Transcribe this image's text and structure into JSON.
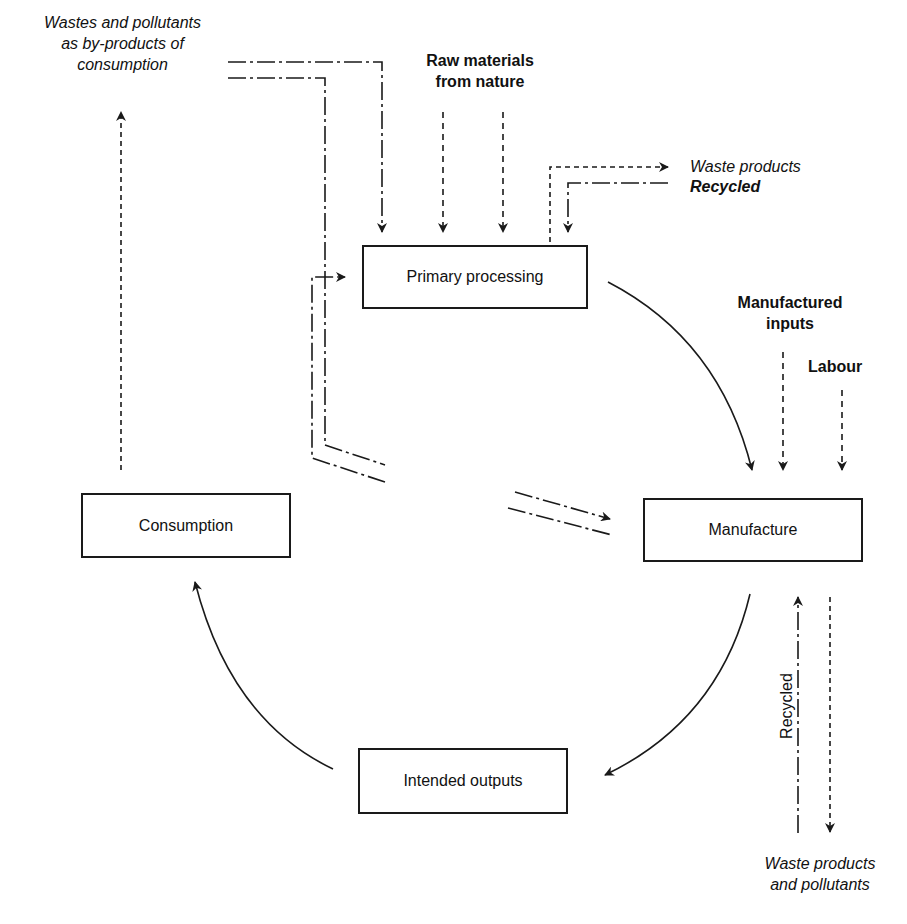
{
  "nodes": {
    "primary_processing": "Primary processing",
    "manufacture": "Manufacture",
    "consumption": "Consumption",
    "intended_outputs": "Intended outputs"
  },
  "labels": {
    "wastes_consumption": [
      "Wastes and pollutants",
      "as by-products of",
      "consumption"
    ],
    "raw_materials": [
      "Raw materials",
      "from nature"
    ],
    "waste_products_top": "Waste products",
    "recycled_top": "Recycled",
    "manufactured_inputs": [
      "Manufactured",
      "inputs"
    ],
    "labour": "Labour",
    "recycled_vertical": "Recycled",
    "waste_products_bottom": [
      "Waste products",
      "and pollutants"
    ]
  },
  "legend_styles": {
    "solid": "main flow",
    "dashed": "inputs / waste",
    "dash_dot": "recycled flow"
  },
  "colors": {
    "line": "#1a1a1a",
    "background": "#ffffff"
  }
}
